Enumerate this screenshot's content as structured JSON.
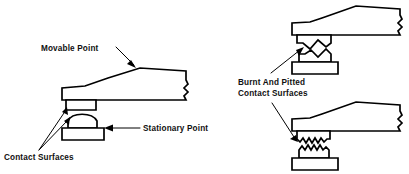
{
  "figure": {
    "title": "",
    "background_color": "#ffffff",
    "line_color": "#000000",
    "width": 409,
    "height": 174
  },
  "labels": {
    "movable_point": "Movable Point",
    "stationary_point": "Stationary Point",
    "contact_surfaces": "Contact Surfaces",
    "burnt_pitted_line1": "Burnt And Pitted",
    "burnt_pitted_line2": "Contact Surfaces"
  },
  "diagrams": {
    "left": {
      "name": "good-contact-points",
      "description": "Breaker point assembly with clean contact surfaces",
      "parts": [
        "movable-arm",
        "movable-contact",
        "stationary-contact",
        "stationary-base"
      ]
    },
    "top_right": {
      "name": "pitted-contact-points-v-shape",
      "description": "Contact surfaces showing crater and peak wear",
      "parts": [
        "movable-arm",
        "movable-contact-pitted",
        "stationary-contact-peaked",
        "stationary-base"
      ]
    },
    "bottom_right": {
      "name": "pitted-contact-points-jagged",
      "description": "Contact surfaces showing jagged burnt pitting",
      "parts": [
        "movable-arm",
        "movable-contact-jagged",
        "stationary-contact-jagged",
        "stationary-base"
      ]
    }
  }
}
